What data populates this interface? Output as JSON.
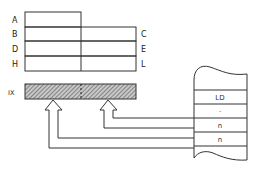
{
  "registers": {
    "left_labels": [
      "A",
      "B",
      "D",
      "H"
    ],
    "right_labels": [
      "C",
      "E",
      "L"
    ],
    "index_register": {
      "label": "IX",
      "fill": "hatched"
    }
  },
  "memory": {
    "cells": [
      "LD",
      "·",
      "n",
      "n"
    ]
  },
  "colors": {
    "line": "#333333",
    "hatch": "#555555",
    "background": "#ffffff"
  }
}
